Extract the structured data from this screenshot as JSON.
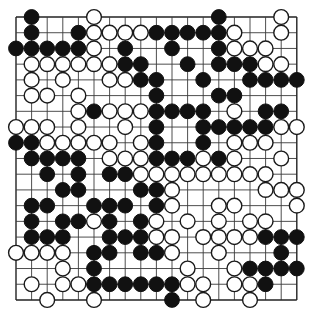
{
  "board": {
    "size": 19,
    "origin_x": 16,
    "origin_y": 17,
    "spacing_x": 15.6,
    "spacing_y": 15.72,
    "stone_radius": 7.4,
    "colors": {
      "line": "#3a3a3a",
      "black_stone": "#111111",
      "white_stone": "#ffffff",
      "white_outline": "#1a1a1a",
      "background": "#ffffff"
    },
    "legend": {
      "B": "black stone",
      "W": "white stone",
      ".": "empty point"
    },
    "rows": [
      ".B...W.......B...W.",
      ".B..BWWWWBBBBBW..W.",
      "BBBBBW.B..B..BWWW..",
      ".WWWWWWBB..B.BBBWW.",
      ".W.W..WWBB..B..BBBB",
      ".WW.W....B...BB....",
      "....WBWWWBBBB.W.BB.",
      "WWW.W..W.B..BBBBBWW",
      "BBWWWWW.WB..B.WWW..",
      ".BBBB.WWWBBBWBW..W.",
      "..B.B.BBWWWWWWWWW..",
      "...BB...BBW.....WWW",
      ".BB..BBB.BW..WW...W",
      ".B.BBWB.BW.W.W.WW..",
      ".BBB..BBBWW.WWWWBBB",
      "WWWW.BB.BBW..W...B.",
      "...W.B.....W..WBBBB",
      ".W.WWBBBBBBWW.WWB..",
      "..W..W....B.W..W..."
    ]
  }
}
